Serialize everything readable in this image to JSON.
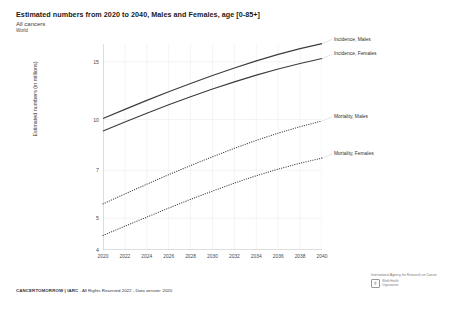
{
  "header": {
    "title": "Estimated numbers from 2020 to 2040, Males and Females, age [0-85+]",
    "subtitle": "All cancers",
    "region": "World"
  },
  "footer": {
    "brand": "CANCERTOMORROW | IARC",
    "rights": " - All Rights Reserved 2022 - Data version: 2020",
    "agency": "International Agency for Research on Cancer",
    "who_line1": "World Health",
    "who_line2": "Organization",
    "who_emblem": "who-emblem-icon"
  },
  "chart_data": {
    "type": "line",
    "title": "Estimated numbers from 2020 to 2040, Males and Females, age [0-85+]",
    "subtitle": "All cancers",
    "region": "World",
    "xlabel": "",
    "ylabel": "Estimated numbers (in millions)",
    "yscale": "log",
    "ylim": [
      4,
      17
    ],
    "xlim": [
      2020,
      2040
    ],
    "grid": true,
    "legend_position": "right-inline",
    "x": [
      2020,
      2022,
      2024,
      2026,
      2028,
      2030,
      2032,
      2034,
      2036,
      2038,
      2040
    ],
    "ytick_labels": [
      "15",
      "10",
      "7",
      "5",
      "4"
    ],
    "ytick_values": [
      15,
      10,
      7,
      5,
      4
    ],
    "xtick_labels": [
      "2020",
      "2022",
      "2024",
      "2026",
      "2028",
      "2030",
      "2032",
      "2034",
      "2036",
      "2038",
      "2040"
    ],
    "series": [
      {
        "name": "Incidence, Males",
        "style": "solid",
        "color": "#3c3c3c",
        "values": [
          10.07,
          10.74,
          11.44,
          12.15,
          12.88,
          13.62,
          14.36,
          15.1,
          15.8,
          16.45,
          17.05
        ]
      },
      {
        "name": "Incidence, Females",
        "style": "solid",
        "color": "#3c3c3c",
        "values": [
          9.23,
          9.83,
          10.45,
          11.09,
          11.74,
          12.39,
          13.03,
          13.66,
          14.26,
          14.83,
          15.36
        ]
      },
      {
        "name": "Mortality, Males",
        "style": "dotted",
        "color": "#3c3c3c",
        "values": [
          5.53,
          5.93,
          6.35,
          6.79,
          7.24,
          7.7,
          8.17,
          8.64,
          9.09,
          9.51,
          9.9
        ]
      },
      {
        "name": "Mortality, Females",
        "style": "dotted",
        "color": "#3c3c3c",
        "values": [
          4.43,
          4.73,
          5.04,
          5.37,
          5.71,
          6.05,
          6.4,
          6.74,
          7.06,
          7.36,
          7.63
        ]
      }
    ]
  }
}
